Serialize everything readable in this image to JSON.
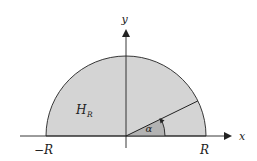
{
  "diagram": {
    "title": "",
    "colors": {
      "background": "#ffffff",
      "region_fill": "#d4d4d4",
      "angle_fill": "#b3b3b3",
      "stroke": "#222222"
    },
    "labels": {
      "y_axis": "y",
      "x_axis": "x",
      "region": "H",
      "region_subscript": "R",
      "neg_radius": "−R",
      "pos_radius": "R",
      "angle": "α"
    },
    "geometry": {
      "origin": [
        126,
        136
      ],
      "radius_px": 80,
      "angle_deg": 26
    }
  }
}
